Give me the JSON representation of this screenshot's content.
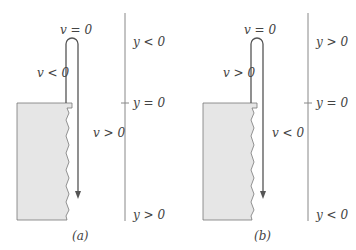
{
  "panels": [
    {
      "caption": "(a)",
      "trajectory_labels": {
        "top": "v = 0",
        "upward": "v < 0",
        "downward": "v > 0"
      },
      "axis_labels": {
        "top": "y < 0",
        "origin": "y = 0",
        "bottom": "y > 0"
      }
    },
    {
      "caption": "(b)",
      "trajectory_labels": {
        "top": "v = 0",
        "upward": "v > 0",
        "downward": "v < 0"
      },
      "axis_labels": {
        "top": "y > 0",
        "origin": "y = 0",
        "bottom": "y < 0"
      }
    }
  ],
  "colors": {
    "cliff_fill": "#e6e6e6",
    "line": "#555555",
    "text": "#444444"
  }
}
